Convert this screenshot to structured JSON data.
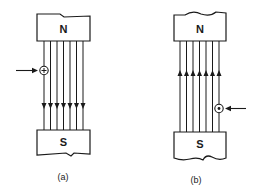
{
  "figure": {
    "panels": [
      {
        "id": "a",
        "caption": "(a)",
        "top_pole": "N",
        "bottom_pole": "S",
        "field_line_count": 7,
        "field_direction": "down",
        "conductor_symbol": "cross-in-circle",
        "conductor_meaning": "current into page",
        "conductor_position": "leftmost field line",
        "pointer_arrow_side": "left"
      },
      {
        "id": "b",
        "caption": "(b)",
        "top_pole": "N",
        "bottom_pole": "S",
        "field_line_count": 7,
        "field_direction": "up",
        "conductor_symbol": "dot-in-circle",
        "conductor_meaning": "current out of page",
        "conductor_position": "rightmost field line",
        "pointer_arrow_side": "right"
      }
    ],
    "colors": {
      "ink": "#1a1a1a",
      "background": "#ffffff"
    }
  }
}
